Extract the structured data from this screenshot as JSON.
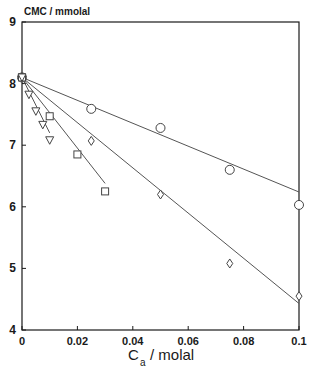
{
  "chart_data": {
    "type": "scatter",
    "title": "",
    "ylabel": "CMC / mmolal",
    "xlabel": "C_a / molal",
    "xlabel_main": "C",
    "xlabel_sub": "a",
    "xlabel_rest": "/  molal",
    "xlim": [
      0,
      0.1
    ],
    "ylim": [
      4,
      9
    ],
    "xticks": [
      0,
      0.02,
      0.04,
      0.06,
      0.08,
      0.1
    ],
    "xtick_labels": [
      "0",
      "0.02",
      "0.04",
      "0.06",
      "0.08",
      "0.1"
    ],
    "yticks": [
      4,
      5,
      6,
      7,
      8,
      9
    ],
    "ytick_labels": [
      "4",
      "5",
      "6",
      "7",
      "8",
      "9"
    ],
    "grid": false,
    "legend": "none",
    "series": [
      {
        "name": "circle",
        "marker": "circle",
        "x": [
          0,
          0.025,
          0.05,
          0.075,
          0.1
        ],
        "y": [
          8.1,
          7.59,
          7.28,
          6.6,
          6.03
        ],
        "fit_line": {
          "x": [
            0,
            0.1
          ],
          "y": [
            8.1,
            6.24
          ]
        }
      },
      {
        "name": "diamond",
        "marker": "diamond",
        "x": [
          0,
          0.025,
          0.05,
          0.075,
          0.1
        ],
        "y": [
          8.1,
          7.07,
          6.2,
          5.08,
          4.55
        ],
        "fit_line": {
          "x": [
            0,
            0.1
          ],
          "y": [
            8.1,
            4.43
          ]
        }
      },
      {
        "name": "square",
        "marker": "square",
        "x": [
          0,
          0.01,
          0.02,
          0.03
        ],
        "y": [
          8.1,
          7.47,
          6.85,
          6.25
        ],
        "fit_line": {
          "x": [
            0,
            0.03
          ],
          "y": [
            8.1,
            6.38
          ]
        }
      },
      {
        "name": "triangle-down",
        "marker": "triangle-down",
        "x": [
          0,
          0.0025,
          0.005,
          0.0075,
          0.01
        ],
        "y": [
          8.1,
          7.82,
          7.55,
          7.33,
          7.08
        ],
        "fit_line": {
          "x": [
            0,
            0.01
          ],
          "y": [
            8.1,
            7.2
          ]
        }
      }
    ]
  },
  "colors": {
    "axis": "#1a1a1a",
    "line": "#555555",
    "marker": "#444444"
  }
}
